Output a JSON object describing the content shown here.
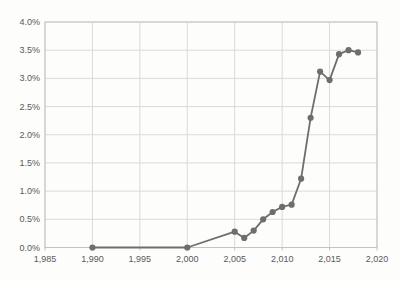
{
  "chart_data": {
    "type": "line",
    "title": "",
    "xlabel": "",
    "ylabel": "",
    "series": [
      {
        "name": "share-percent",
        "x": [
          1990,
          2000,
          2005,
          2006,
          2007,
          2008,
          2009,
          2010,
          2011,
          2012,
          2013,
          2014,
          2015,
          2016,
          2017,
          2018
        ],
        "values": [
          0.0,
          0.0,
          0.28,
          0.17,
          0.3,
          0.5,
          0.63,
          0.72,
          0.76,
          1.22,
          2.3,
          3.12,
          2.97,
          3.43,
          3.5,
          3.46
        ]
      }
    ],
    "xlim": [
      1985,
      2020
    ],
    "ylim": [
      0,
      4
    ],
    "x_ticks": [
      1985,
      1990,
      1995,
      2000,
      2005,
      2010,
      2015,
      2020
    ],
    "x_tick_labels": [
      "1,985",
      "1,990",
      "1,995",
      "2,000",
      "2,005",
      "2,010",
      "2,015",
      "2,020"
    ],
    "y_ticks": [
      0,
      0.5,
      1,
      1.5,
      2,
      2.5,
      3,
      3.5,
      4
    ],
    "y_tick_labels": [
      "0.0%",
      "0.5%",
      "1.0%",
      "1.5%",
      "2.0%",
      "2.5%",
      "3.0%",
      "3.5%",
      "4.0%"
    ],
    "grid": true,
    "legend": false,
    "plot_border": true,
    "marker": "circle"
  },
  "colors": {
    "background": "#fdfdfc",
    "gridline": "#dadada",
    "axis": "#c3c3c3",
    "tick_label": "#595959",
    "series": "#6e6e6e"
  },
  "layout": {
    "plot_left": 45,
    "plot_right": 377,
    "plot_top": 22,
    "plot_bottom": 247.5,
    "x_label_y": 259,
    "y_label_x": 40,
    "tick_length": 3,
    "marker_radius": 3.1,
    "line_width": 1.8
  }
}
